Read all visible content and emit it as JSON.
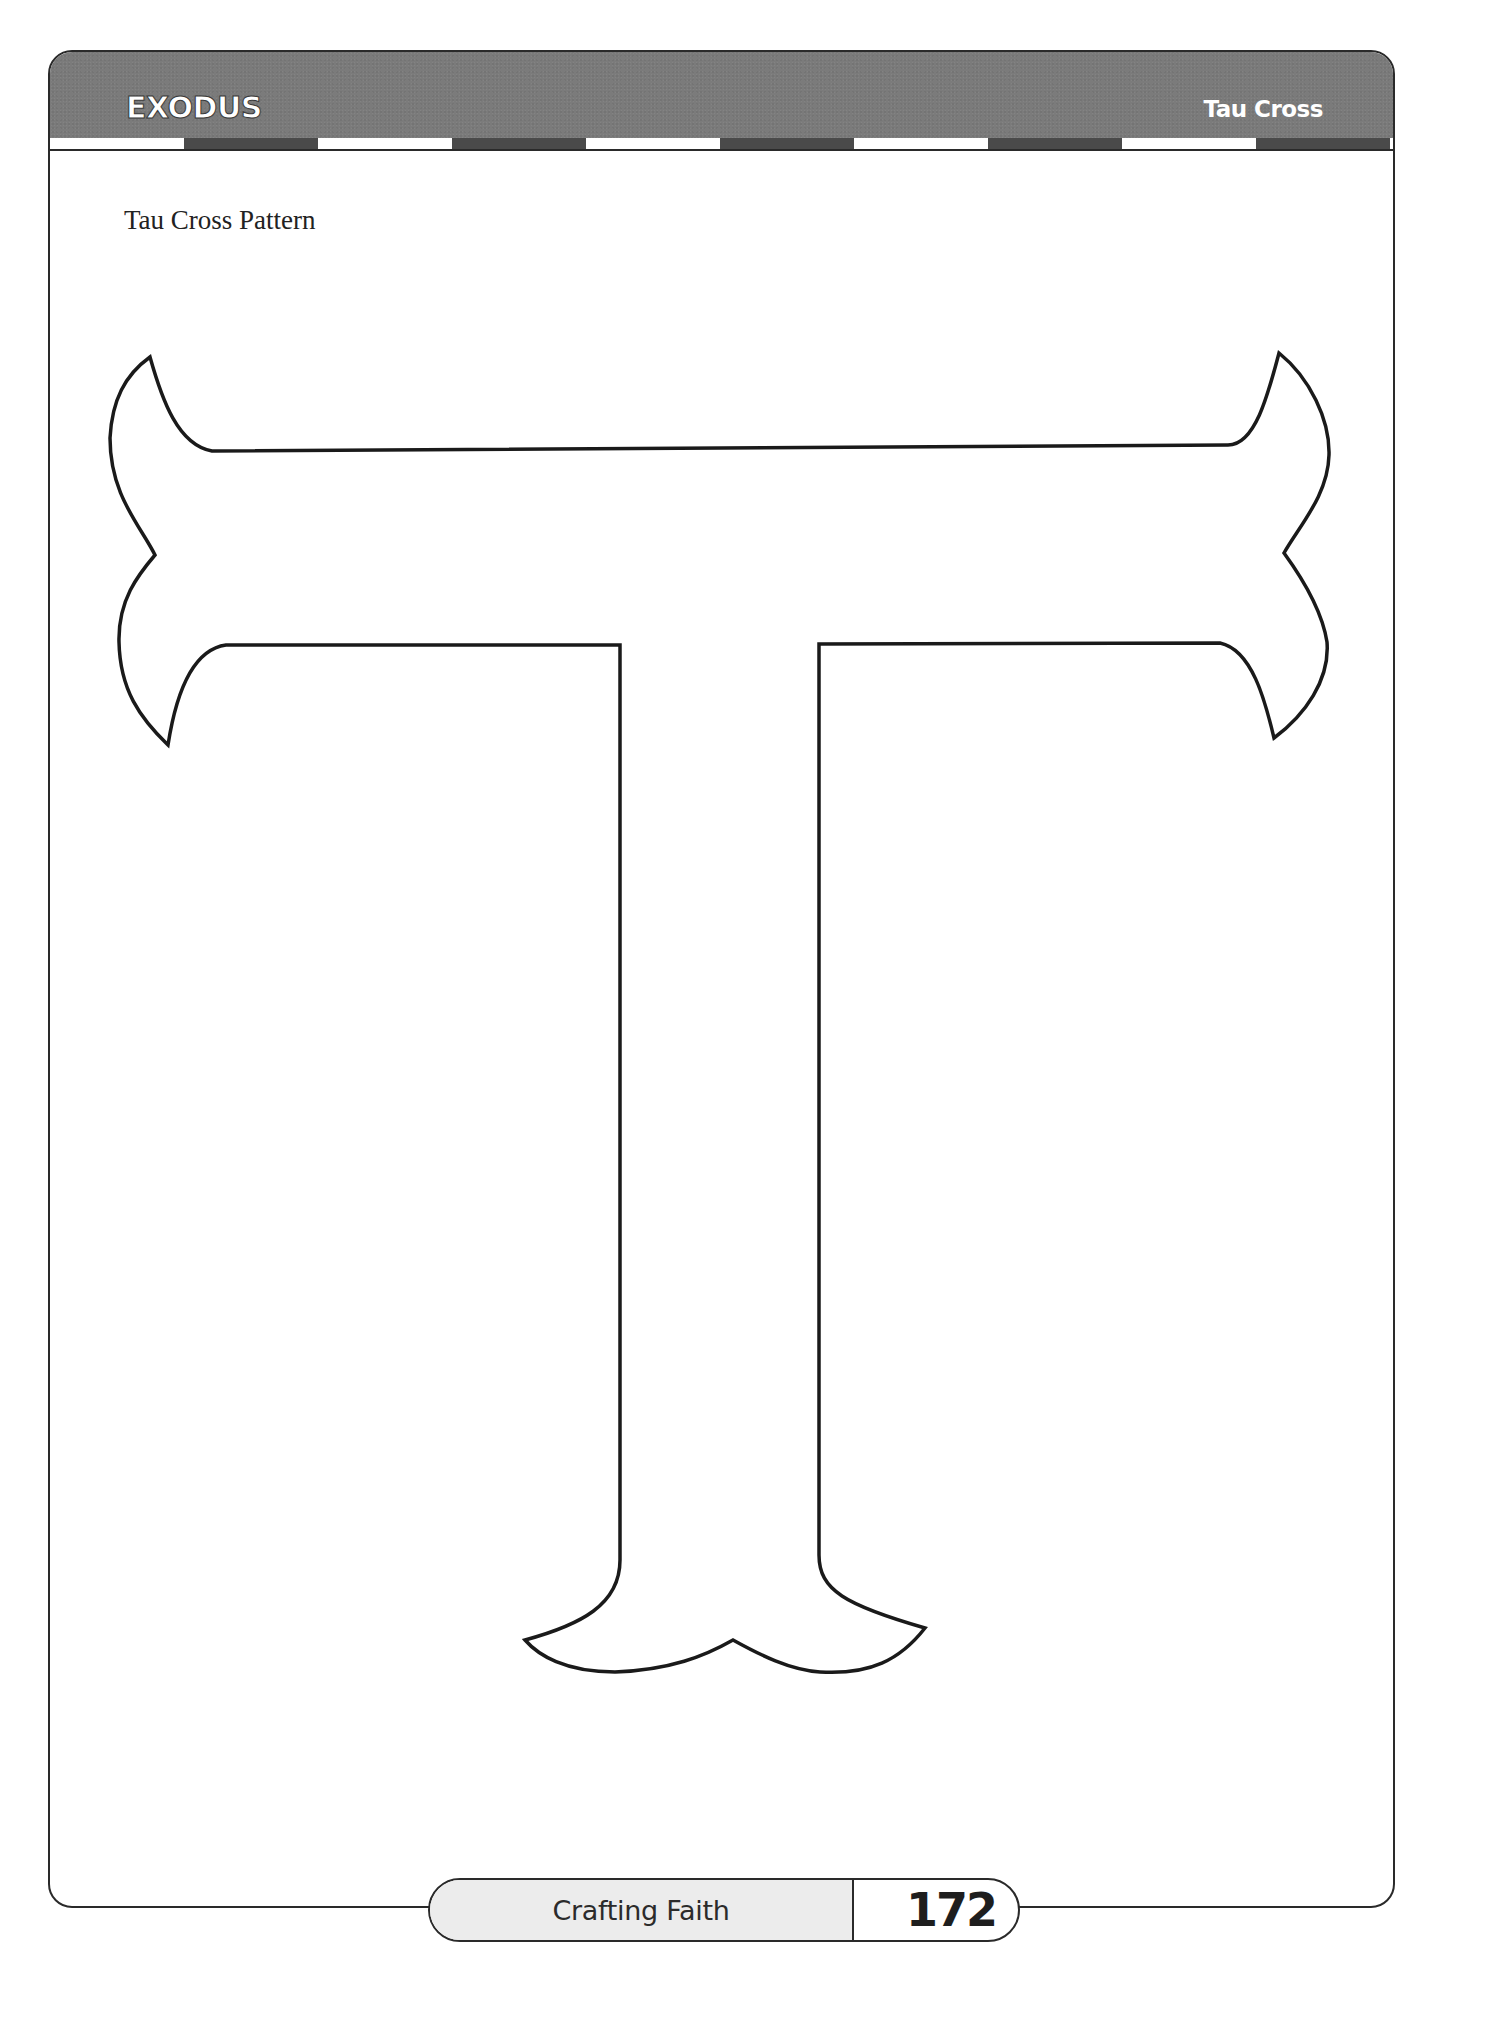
{
  "header": {
    "section_title": "EXODUS",
    "topic_title": "Tau Cross",
    "stripe_pattern": [
      "light",
      "dark",
      "light",
      "dark",
      "light",
      "dark",
      "light",
      "dark",
      "light",
      "dark",
      "light"
    ]
  },
  "content": {
    "pattern_label": "Tau Cross Pattern",
    "shape_icon": "tau-cross-outline"
  },
  "footer": {
    "book_title": "Crafting Faith",
    "page_number": "172"
  },
  "colors": {
    "header_gray": "#7b7b7b",
    "stripe_dark": "#4a4a4a",
    "outline": "#1a1a1a",
    "footer_fill": "#ececec"
  }
}
